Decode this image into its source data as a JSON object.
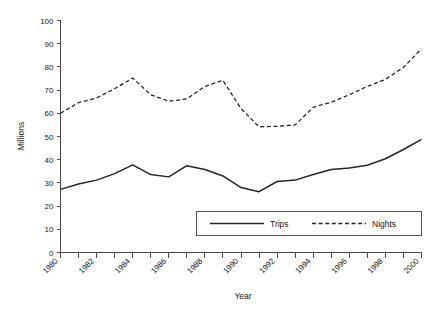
{
  "chart_data": {
    "type": "line",
    "title": "",
    "xlabel": "Year",
    "ylabel": "Millions",
    "xlim": [
      1980,
      2000
    ],
    "ylim": [
      0,
      100
    ],
    "grid": false,
    "legend_position": "inside-bottom-right",
    "x": [
      1980,
      1981,
      1982,
      1983,
      1984,
      1985,
      1986,
      1987,
      1988,
      1989,
      1990,
      1991,
      1992,
      1993,
      1994,
      1995,
      1996,
      1997,
      1998,
      1999,
      2000
    ],
    "x_tick_labels": [
      "1980",
      "1982",
      "1984",
      "1986",
      "1988",
      "1990",
      "1992",
      "1994",
      "1996",
      "1998",
      "2000"
    ],
    "y_tick_labels": [
      "0",
      "10",
      "20",
      "30",
      "40",
      "50",
      "60",
      "70",
      "80",
      "90",
      "100"
    ],
    "y_ticks": [
      0,
      10,
      20,
      30,
      40,
      50,
      60,
      70,
      80,
      90,
      100
    ],
    "series": [
      {
        "name": "Trips",
        "style": "solid",
        "color": "#262626",
        "values": [
          27.2,
          29.5,
          31.2,
          34.0,
          37.8,
          33.6,
          32.6,
          37.4,
          35.8,
          33.0,
          28.0,
          26.2,
          30.6,
          31.2,
          33.6,
          35.8,
          36.4,
          37.6,
          40.4,
          44.4,
          48.8
        ]
      },
      {
        "name": "Nights",
        "style": "dashed",
        "color": "#262626",
        "values": [
          60.0,
          64.6,
          66.6,
          70.6,
          75.2,
          68.0,
          65.2,
          66.2,
          71.6,
          74.2,
          62.0,
          54.2,
          54.4,
          55.0,
          62.6,
          64.8,
          68.0,
          71.6,
          74.6,
          79.8,
          87.8
        ]
      }
    ]
  },
  "legend": {
    "entries": [
      {
        "label": "Trips",
        "style": "solid"
      },
      {
        "label": "Nights",
        "style": "dashed"
      }
    ]
  },
  "colors": {
    "line": "#262626",
    "axis": "#4d4d4d",
    "text": "#1a1a1a",
    "background": "#ffffff"
  }
}
